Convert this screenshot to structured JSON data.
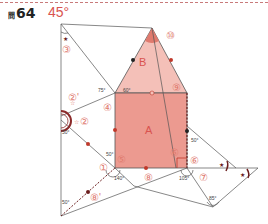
{
  "header": {
    "question_mark": "問",
    "question_number": "64",
    "answer": "45°"
  },
  "colors": {
    "accent": "#d9534f",
    "fill_square": "#ec9a90",
    "fill_triangle": "#f4c0b8",
    "line": "#555555",
    "dark_marker": "#6b1e1e"
  },
  "shapes": {
    "square_label": "A",
    "triangle_label": "B"
  },
  "step_labels": [
    "①",
    "②",
    "②'",
    "③",
    "④",
    "⑤",
    "⑥",
    "⑥",
    "⑦",
    "⑧",
    "⑧'",
    "⑨",
    "⑩"
  ],
  "angles": {
    "a60": "60°",
    "a75": "75°",
    "a50_left": "50°",
    "a50_mid": "50°",
    "a50_right": "50°",
    "a50_bottom": "50°",
    "a140": "140°",
    "a105": "105°",
    "a85": "85°"
  },
  "markers": {
    "star": "★",
    "star_outline": "☆"
  }
}
